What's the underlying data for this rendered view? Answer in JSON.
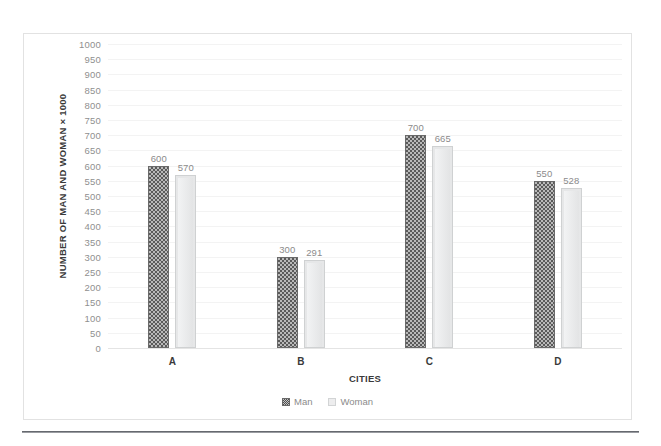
{
  "chart_data": {
    "type": "bar",
    "title": "",
    "xlabel": "CITIES",
    "ylabel": "NUMBER OF MAN AND WOMAN × 1000",
    "categories": [
      "A",
      "B",
      "C",
      "D"
    ],
    "series": [
      {
        "name": "Man",
        "values": [
          600,
          300,
          700,
          550
        ]
      },
      {
        "name": "Woman",
        "values": [
          570,
          291,
          665,
          528
        ]
      }
    ],
    "ylim": [
      0,
      1000
    ],
    "ytick_step": 50,
    "yticks": [
      1000,
      950,
      900,
      850,
      800,
      750,
      700,
      650,
      600,
      550,
      500,
      450,
      400,
      350,
      300,
      250,
      200,
      150,
      100,
      50,
      0
    ],
    "grid": true,
    "legend_position": "bottom",
    "data_labels": true,
    "colors": {
      "man": "#6e6e6e",
      "woman": "#e6e7e8",
      "label_text": "#8b8b8b",
      "axis_text": "#3a3a3a",
      "tick_text": "#8f8f8f",
      "gridline": "#f3f3f3",
      "frame_border": "#e2e2e2"
    }
  },
  "legend": {
    "items": [
      {
        "label": "Man",
        "swatch": "man"
      },
      {
        "label": "Woman",
        "swatch": "woman"
      }
    ]
  }
}
